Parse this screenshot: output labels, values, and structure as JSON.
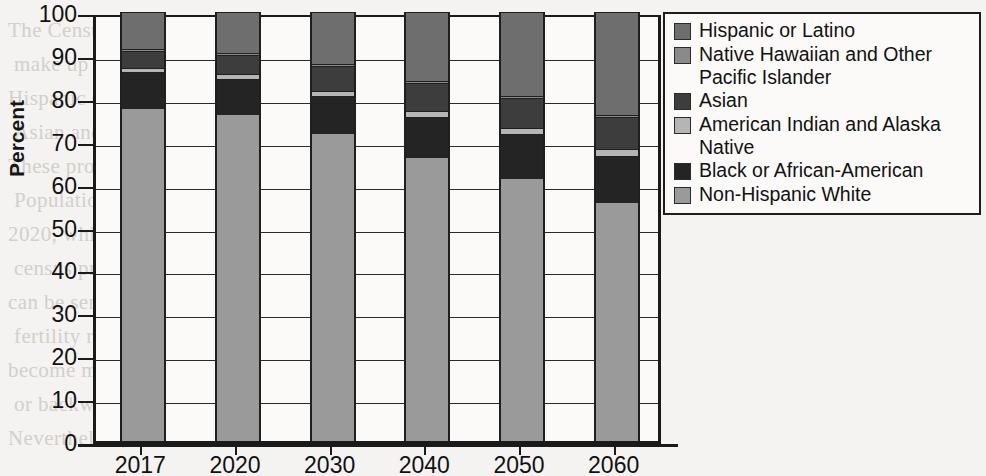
{
  "figure": {
    "y_axis_title": "Percent",
    "background_text": [
      "The Census Bureau projects that non-Hispanic Whites will",
      "make up less than half of the population by 2045, while the",
      "Hispanic or Latino population continues to grow along with",
      "Asian and multiracial populations across the United States.",
      "These projections are based on the most recent 2017 National",
      "Population Projections released by the U.S. Census Bureau in",
      "2020, which would be the basis of the decennial census",
      "census process. Demographers caution that such projections",
      "can be sensitive to assumptions about immigration levels and",
      "fertility rates, so the precise year at which the country would",
      "become majority-minority is uncertain and may shift forward",
      "or backward depending on policy and economic conditions.",
      "Nevertheless, the overall direction of the trend is clear."
    ]
  },
  "legend": {
    "items": [
      {
        "label": "Hispanic or Latino",
        "color": "#6e6e6e"
      },
      {
        "label": "Native Hawaiian and Other\nPacific Islander",
        "color": "#8a8a8a"
      },
      {
        "label": "Asian",
        "color": "#3d3d3d"
      },
      {
        "label": "American Indian and Alaska Native",
        "color": "#b5b5b5"
      },
      {
        "label": "Black or African-American",
        "color": "#242424"
      },
      {
        "label": "Non-Hispanic White",
        "color": "#9a9a9a"
      }
    ]
  },
  "chart_data": {
    "type": "bar",
    "subtype": "stacked-bar-100-percent",
    "title": "",
    "xlabel": "",
    "ylabel": "Percent",
    "ylim": [
      0,
      100
    ],
    "yticks": [
      0,
      10,
      20,
      30,
      40,
      50,
      60,
      70,
      80,
      90,
      100
    ],
    "ytick_labels": [
      "0",
      "10",
      "20",
      "30",
      "40",
      "50",
      "60",
      "70",
      "80",
      "90",
      "100"
    ],
    "grid": true,
    "legend_position": "right",
    "categories": [
      "2017",
      "2020",
      "2030",
      "2040",
      "2050",
      "2060"
    ],
    "series": [
      {
        "name": "Non-Hispanic White",
        "color": "#9a9a9a",
        "values": [
          77.5,
          76.0,
          71.5,
          66.0,
          61.0,
          55.5
        ]
      },
      {
        "name": "Black or African-American",
        "color": "#242424",
        "values": [
          8.5,
          8.5,
          9.0,
          9.5,
          10.5,
          11.0
        ]
      },
      {
        "name": "American Indian and Alaska Native",
        "color": "#b5b5b5",
        "values": [
          1.0,
          1.0,
          1.0,
          1.5,
          1.5,
          1.5
        ]
      },
      {
        "name": "Asian",
        "color": "#3d3d3d",
        "values": [
          4.0,
          4.5,
          6.0,
          6.5,
          7.0,
          7.5
        ]
      },
      {
        "name": "Native Hawaiian and Other Pacific Islander",
        "color": "#8a8a8a",
        "values": [
          0.5,
          0.5,
          0.5,
          0.5,
          0.5,
          0.5
        ]
      },
      {
        "name": "Hispanic or Latino",
        "color": "#6e6e6e",
        "values": [
          8.5,
          9.5,
          12.0,
          16.0,
          19.5,
          24.0
        ]
      }
    ]
  }
}
